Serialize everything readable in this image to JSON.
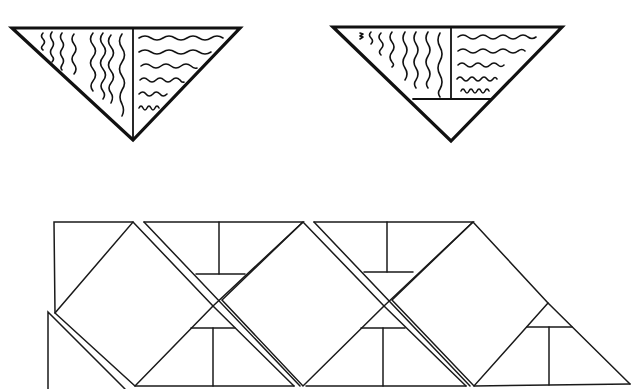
{
  "figure": {
    "colors": {
      "ink": "#111111",
      "background": "#ffffff"
    },
    "top_left_triangle": {
      "label": "triangle-with-two-grain-regions",
      "vertical_wave_count": 8,
      "horizontal_wave_count": 6
    },
    "top_right_triangle": {
      "label": "triangle-with-two-grain-regions-and-bottom-cutoff",
      "vertical_wave_count": 8,
      "horizontal_wave_count": 5
    },
    "bottom_strip": {
      "label": "tiled-diamond-and-triangle-pattern",
      "repeat_units": 3
    }
  }
}
